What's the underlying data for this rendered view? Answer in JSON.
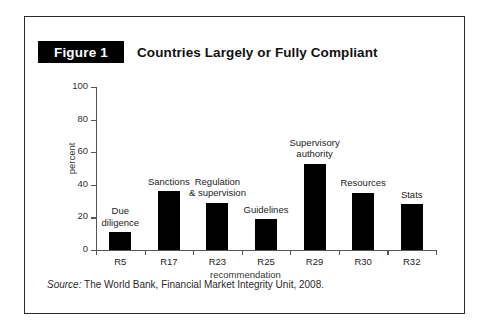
{
  "figure": {
    "tag": "Figure 1",
    "title": "Countries Largely or Fully Compliant",
    "source_prefix": "Source:",
    "source_text": " The World Bank, Financial Market Integrity Unit, 2008."
  },
  "colors": {
    "bar": "#000000",
    "tag_background": "#000000",
    "tag_text": "#ffffff",
    "frame_border": "#2b2b2b",
    "axis": "#555555",
    "text": "#222222",
    "page_background": "#ffffff"
  },
  "chart_data": {
    "type": "bar",
    "title": "Countries Largely or Fully Compliant",
    "xlabel": "recommendation",
    "ylabel": "percent",
    "ylim": [
      0,
      100
    ],
    "yticks": [
      0,
      20,
      40,
      60,
      80,
      100
    ],
    "grid": false,
    "legend": "none",
    "categories": [
      "R5",
      "R17",
      "R23",
      "R25",
      "R29",
      "R30",
      "R32"
    ],
    "values": [
      11,
      36,
      29,
      19,
      53,
      35,
      28
    ],
    "point_labels": [
      "Due\ndiligence",
      "Sanctions",
      "Regulation\n& supervision",
      "Guidelines",
      "Supervisory\nauthority",
      "Resources",
      "Stats"
    ],
    "annotations": [
      {
        "category": "R5",
        "label": "Due diligence"
      },
      {
        "category": "R17",
        "label": "Sanctions"
      },
      {
        "category": "R23",
        "label": "Regulation & supervision"
      },
      {
        "category": "R25",
        "label": "Guidelines"
      },
      {
        "category": "R29",
        "label": "Supervisory authority"
      },
      {
        "category": "R30",
        "label": "Resources"
      },
      {
        "category": "R32",
        "label": "Stats"
      }
    ]
  }
}
